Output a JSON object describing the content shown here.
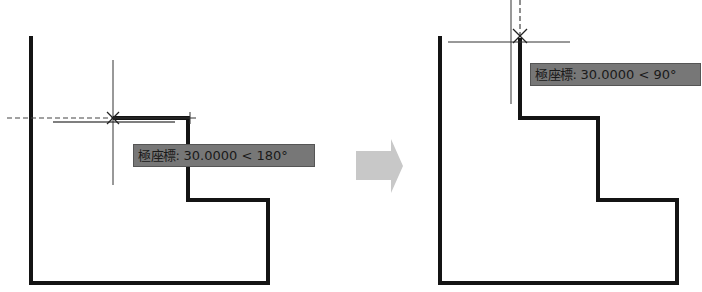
{
  "colors": {
    "background": "#ffffff",
    "outline": "#141414",
    "crosshair": "#333333",
    "tooltip_bg": "#777777",
    "tooltip_text": "#1a1a1a",
    "arrow": "#c8c8c8"
  },
  "left_panel": {
    "tooltip": {
      "label": "極座標:",
      "value": "30.0000 < 180°"
    },
    "polar_distance": "30.0000",
    "polar_angle": "180°"
  },
  "right_panel": {
    "tooltip": {
      "label": "極座標:",
      "value": "30.0000 < 90°"
    },
    "polar_distance": "30.0000",
    "polar_angle": "90°"
  },
  "transition_arrow": "right-arrow"
}
